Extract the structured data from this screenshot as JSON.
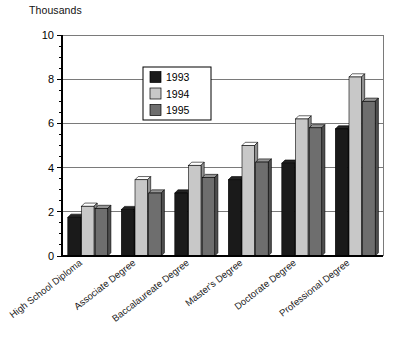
{
  "chart_data": {
    "type": "bar",
    "title": "",
    "unit_label": "Thousands",
    "xlabel": "",
    "ylabel": "",
    "ylim": [
      0,
      10
    ],
    "ytick_values": [
      0,
      2,
      4,
      6,
      8,
      10
    ],
    "ytick_labels": [
      "0",
      "2",
      "4",
      "6",
      "8",
      "10"
    ],
    "yminor_step": 0.5,
    "grid": true,
    "legend_position": "upper-center",
    "categories": [
      "High School Diploma",
      "Associate Degree",
      "Baccalaureate Degree",
      "Master's Degree",
      "Doctorate Degree",
      "Professional Degree"
    ],
    "series": [
      {
        "name": "1993",
        "color": "#1a1a1a",
        "values": [
          1.75,
          2.1,
          2.85,
          3.45,
          4.2,
          5.75
        ]
      },
      {
        "name": "1994",
        "color": "#c8c8c8",
        "values": [
          2.25,
          3.45,
          4.1,
          5.0,
          6.2,
          8.1
        ]
      },
      {
        "name": "1995",
        "color": "#6e6e6e",
        "values": [
          2.15,
          2.85,
          3.55,
          4.25,
          5.8,
          7.0
        ]
      }
    ]
  },
  "legend": {
    "entries": [
      {
        "label": "1993",
        "color": "#1a1a1a"
      },
      {
        "label": "1994",
        "color": "#c8c8c8"
      },
      {
        "label": "1995",
        "color": "#6e6e6e"
      }
    ]
  },
  "axis": {
    "unit_label": "Thousands",
    "y_labels": [
      "10",
      "8",
      "6",
      "4",
      "2",
      "0"
    ]
  },
  "colors": {
    "series_1993": "#1a1a1a",
    "series_1994": "#c8c8c8",
    "series_1995": "#6e6e6e",
    "axis": "#000000",
    "grid": "#6b6b6b",
    "background": "#ffffff"
  }
}
